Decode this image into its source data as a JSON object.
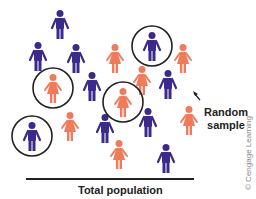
{
  "figure": {
    "labels": {
      "random_sample_line1": "Random",
      "random_sample_line2": "sample",
      "total_population": "Total population",
      "credit": "© Cengage Learning"
    },
    "colors": {
      "male": "#3b2a8c",
      "female": "#f07a5a",
      "circle": "#222222"
    },
    "people": [
      {
        "type": "male",
        "x": 60,
        "y": 10,
        "circled": false
      },
      {
        "type": "male",
        "x": 38,
        "y": 42,
        "circled": false
      },
      {
        "type": "male",
        "x": 76,
        "y": 44,
        "circled": false
      },
      {
        "type": "male",
        "x": 92,
        "y": 72,
        "circled": false
      },
      {
        "type": "male",
        "x": 152,
        "y": 32,
        "circled": true
      },
      {
        "type": "male",
        "x": 168,
        "y": 70,
        "circled": false
      },
      {
        "type": "male",
        "x": 32,
        "y": 122,
        "circled": true
      },
      {
        "type": "male",
        "x": 105,
        "y": 114,
        "circled": false
      },
      {
        "type": "male",
        "x": 148,
        "y": 108,
        "circled": false
      },
      {
        "type": "male",
        "x": 166,
        "y": 144,
        "circled": false
      },
      {
        "type": "female",
        "x": 115,
        "y": 44,
        "circled": false
      },
      {
        "type": "female",
        "x": 183,
        "y": 44,
        "circled": false
      },
      {
        "type": "female",
        "x": 53,
        "y": 74,
        "circled": true
      },
      {
        "type": "female",
        "x": 142,
        "y": 66,
        "circled": false
      },
      {
        "type": "female",
        "x": 123,
        "y": 88,
        "circled": true
      },
      {
        "type": "female",
        "x": 70,
        "y": 112,
        "circled": false
      },
      {
        "type": "female",
        "x": 189,
        "y": 106,
        "circled": false
      },
      {
        "type": "female",
        "x": 119,
        "y": 140,
        "circled": false
      }
    ]
  }
}
